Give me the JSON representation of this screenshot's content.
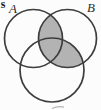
{
  "colors": {
    "background": "#fcfcfc",
    "shade": "#b3b3b3",
    "stroke": "#3d3d3d"
  },
  "diagram": {
    "type": "venn-3-circle",
    "labels": {
      "a": "A",
      "b": "B"
    },
    "corner_fragment": "s",
    "shaded_region_expression": "(A ∩ B) ∪ (B ∩ C)",
    "unshaded_regions": "A only, B only, C only, A ∩ C only",
    "bottom_label_cut_off": true
  }
}
